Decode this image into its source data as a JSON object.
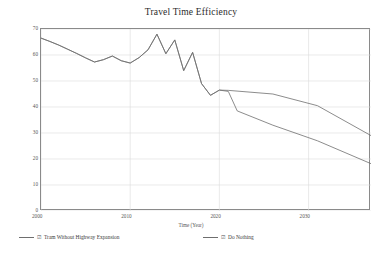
{
  "chart_data": {
    "type": "line",
    "title": "Travel Time Efficiency",
    "xlabel": "Time (Year)",
    "ylabel": "Percent",
    "xlim": [
      2000,
      2037
    ],
    "ylim": [
      0,
      70
    ],
    "grid": true,
    "legend_position": "bottom",
    "xticks": [
      "2000",
      "2010",
      "2020",
      "2030"
    ],
    "xtick_values": [
      2000,
      2010,
      2020,
      2030
    ],
    "yticks": [
      "0",
      "10",
      "20",
      "30",
      "40",
      "50",
      "60",
      "70"
    ],
    "ytick_values": [
      0,
      10,
      20,
      30,
      40,
      50,
      60,
      70
    ],
    "line_color": "#6e6e6e",
    "series": [
      {
        "name": "Tram Without Highway Expansion",
        "checked": true,
        "x": [
          2000,
          2001,
          2002,
          2003,
          2004,
          2005,
          2006,
          2007,
          2008,
          2009,
          2010,
          2011,
          2012,
          2013,
          2014,
          2015,
          2016,
          2017,
          2018,
          2019,
          2020,
          2021,
          2026,
          2031,
          2037
        ],
        "values": [
          66.5,
          65.2,
          63.8,
          62.2,
          60.6,
          58.9,
          57.3,
          58.2,
          59.6,
          57.8,
          56.9,
          59.0,
          62.0,
          68.0,
          60.5,
          65.8,
          54.0,
          61.0,
          49.0,
          44.5,
          46.5,
          46.4,
          45.0,
          40.5,
          29.0
        ]
      },
      {
        "name": "Do Nothing",
        "checked": true,
        "x": [
          2000,
          2001,
          2002,
          2003,
          2004,
          2005,
          2006,
          2007,
          2008,
          2009,
          2010,
          2011,
          2012,
          2013,
          2014,
          2015,
          2016,
          2017,
          2018,
          2019,
          2020,
          2021,
          2022,
          2026,
          2031,
          2037
        ],
        "values": [
          66.5,
          65.2,
          63.8,
          62.2,
          60.6,
          58.9,
          57.3,
          58.2,
          59.6,
          57.8,
          56.9,
          59.0,
          62.0,
          68.0,
          60.5,
          65.8,
          54.0,
          61.0,
          49.0,
          44.5,
          46.5,
          46.0,
          38.5,
          33.0,
          27.0,
          18.2
        ]
      }
    ]
  },
  "legend": {
    "items": [
      {
        "label": "Tram Without Highway Expansion",
        "check_glyph": "☑"
      },
      {
        "label": "Do Nothing",
        "check_glyph": "☑"
      }
    ]
  }
}
